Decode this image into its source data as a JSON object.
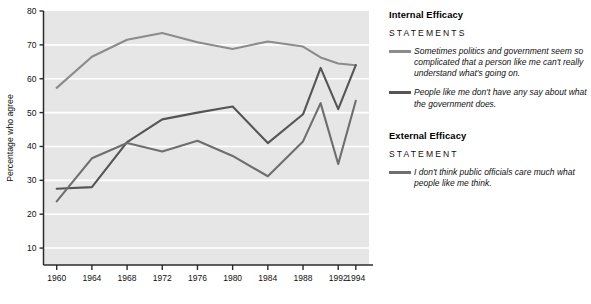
{
  "chart_data": {
    "type": "line",
    "title": "",
    "xlabel": "",
    "ylabel": "Percentage who agree",
    "xlim": [
      1958.5,
      1995.5
    ],
    "ylim": [
      5,
      80
    ],
    "yticks": [
      10,
      20,
      30,
      40,
      50,
      60,
      70,
      80
    ],
    "ytick_labels": [
      "10",
      "20",
      "30",
      "40",
      "50",
      "60",
      "70",
      "80"
    ],
    "xticks": [
      1960,
      1964,
      1968,
      1972,
      1976,
      1980,
      1984,
      1988,
      1992,
      1994
    ],
    "xtick_labels": [
      "1960",
      "1964",
      "1968",
      "1972",
      "1976",
      "1980",
      "1984",
      "1988",
      "1992",
      "1994"
    ],
    "grid": "horizontal-white",
    "legend_position": "right",
    "plot_background": "#e6e6e6",
    "series": [
      {
        "name": "Sometimes politics and government seem so complicated that a person like me can't really understand what's going on.",
        "short_name": "politics-too-complicated",
        "color": "#8b8b8b",
        "x": [
          1960,
          1964,
          1968,
          1972,
          1976,
          1980,
          1984,
          1988,
          1990,
          1992,
          1994
        ],
        "values": [
          57.3,
          66.5,
          71.5,
          73.5,
          70.8,
          68.8,
          71.0,
          69.5,
          66.3,
          64.5,
          64.0
        ]
      },
      {
        "name": "People like me don't have any say about what the government does.",
        "short_name": "no-say-in-government",
        "color": "#555555",
        "x": [
          1960,
          1964,
          1968,
          1972,
          1976,
          1980,
          1984,
          1988,
          1990,
          1992,
          1994
        ],
        "values": [
          27.5,
          28.0,
          41.3,
          48.0,
          50.0,
          51.8,
          41.0,
          49.5,
          63.2,
          51.0,
          64.0
        ]
      },
      {
        "name": "I don't think public officials care much what people like me think.",
        "short_name": "officials-dont-care",
        "color": "#6e6e6e",
        "x": [
          1960,
          1964,
          1968,
          1972,
          1976,
          1980,
          1984,
          1988,
          1990,
          1992,
          1994
        ],
        "values": [
          23.8,
          36.5,
          41.0,
          38.5,
          41.7,
          37.2,
          31.2,
          41.5,
          52.8,
          34.8,
          53.5
        ]
      }
    ]
  },
  "legend": {
    "groups": [
      {
        "heading": "Internal Efficacy",
        "subheading": "STATEMENTS",
        "entries": [
          {
            "text": "Sometimes politics and government seem so complicated that a person like me can't really understand what's going on.",
            "color": "#8b8b8b"
          },
          {
            "text": "People like me don't have any say about what the government does.",
            "color": "#555555"
          }
        ]
      },
      {
        "heading": "External Efficacy",
        "subheading": "STATEMENT",
        "entries": [
          {
            "text": "I don't think public officials care much what people like me think.",
            "color": "#6e6e6e"
          }
        ]
      }
    ]
  }
}
